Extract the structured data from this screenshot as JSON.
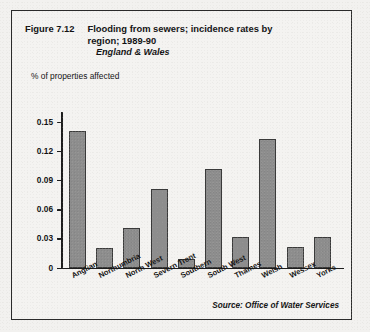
{
  "figure": {
    "number": "Figure 7.12",
    "title": "Flooding from sewers; incidence rates by region; 1989-90",
    "subtitle": "England & Wales",
    "source": "Source: Office of Water Services",
    "frame_color": "#2b2b2b",
    "bar_fill": "#8d8d8d",
    "bar_stroke": "#3a3a3a"
  },
  "chart_data": {
    "type": "bar",
    "title": "Flooding from sewers; incidence rates by region; 1989-90",
    "subtitle": "England & Wales",
    "xlabel": "",
    "ylabel": "% of properties affected",
    "ylim": [
      0,
      0.15
    ],
    "grid": false,
    "legend": "none",
    "ytick_labels": [
      "0.15",
      "0.12",
      "0.09",
      "0.06",
      "0.03",
      "0"
    ],
    "ytick_values": [
      0.15,
      0.12,
      0.09,
      0.06,
      0.03,
      0
    ],
    "categories": [
      "Anglian",
      "Northumbria",
      "North West",
      "Severn Trent",
      "Southern",
      "South West",
      "Thames",
      "Welsh",
      "Wessex",
      "Yorks"
    ],
    "values": [
      0.141,
      0.02,
      0.041,
      0.081,
      0.009,
      0.102,
      0.031,
      0.133,
      0.021,
      0.031
    ],
    "source": "Source: Office of Water Services"
  }
}
